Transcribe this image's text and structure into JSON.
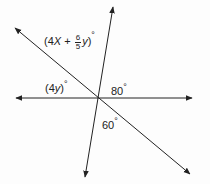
{
  "diagram": {
    "type": "intersecting-lines-angles",
    "lines": [
      {
        "name": "horizontal",
        "x1": 16,
        "y1": 98,
        "x2": 192,
        "y2": 98
      },
      {
        "name": "steep",
        "x1": 113,
        "y1": 7,
        "x2": 85,
        "y2": 177
      },
      {
        "name": "diagonal",
        "x1": 15,
        "y1": 28,
        "x2": 190,
        "y2": 174
      }
    ],
    "labels": {
      "top_angle": {
        "open": "(4",
        "var1": "X",
        "plus": " + ",
        "frac_num": "6",
        "frac_den": "5",
        "var2": "y",
        "close": ")",
        "deg": "°"
      },
      "left_angle": {
        "open": "(4",
        "var": "y",
        "close": ")",
        "deg": "°"
      },
      "right_angle": {
        "value": "80",
        "deg": "°"
      },
      "bottom_angle": {
        "value": "60",
        "deg": "°"
      }
    },
    "colors": {
      "line": "#222222",
      "background": "#fdfdfd"
    }
  }
}
